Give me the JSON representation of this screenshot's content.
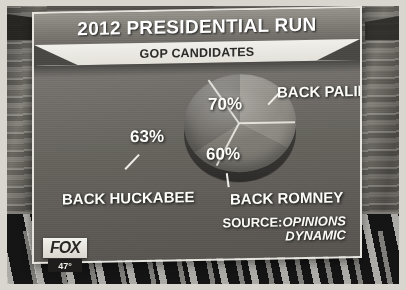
{
  "broadcast": {
    "network_bug": "FOX",
    "temperature": "47°"
  },
  "graphic": {
    "title": "2012 PRESIDENTIAL RUN",
    "subtitle": "GOP CANDIDATES",
    "source_prefix": "SOURCE:",
    "source_name_line1": "OPINIONS",
    "source_name_line2": "DYNAMIC"
  },
  "colors": {
    "panel_border": "#e6e4de",
    "panel_bg": "#6e6b66",
    "subtitle_band": "#f2f0ea",
    "label_text": "#fdfdfa",
    "slice_palin": "#8e8b84",
    "slice_romney": "#7e7b75",
    "slice_huckabee": "#6e6b66"
  },
  "chart_data": {
    "type": "pie",
    "title": "2012 PRESIDENTIAL RUN",
    "subtitle": "GOP CANDIDATES",
    "categories": [
      "BACK PALIN",
      "BACK HUCKABEE",
      "BACK ROMNEY"
    ],
    "values": [
      70,
      63,
      60
    ],
    "value_labels": [
      "70%",
      "63%",
      "60%"
    ],
    "unit": "%",
    "total": 193,
    "note": "Slices are drawn as thirds of the circle although the labelled values sum to 193%.",
    "source": "SOURCE:OPINIONS DYNAMIC",
    "legend": "none",
    "grid": false,
    "slices": [
      {
        "label": "BACK PALIN",
        "value": 70,
        "value_label": "70%",
        "color": "#8e8b84",
        "sweep_deg": 118
      },
      {
        "label": "BACK ROMNEY",
        "value": 60,
        "value_label": "60%",
        "color": "#7e7b75",
        "sweep_deg": 120
      },
      {
        "label": "BACK HUCKABEE",
        "value": 63,
        "value_label": "63%",
        "color": "#6e6b66",
        "sweep_deg": 122
      }
    ]
  }
}
